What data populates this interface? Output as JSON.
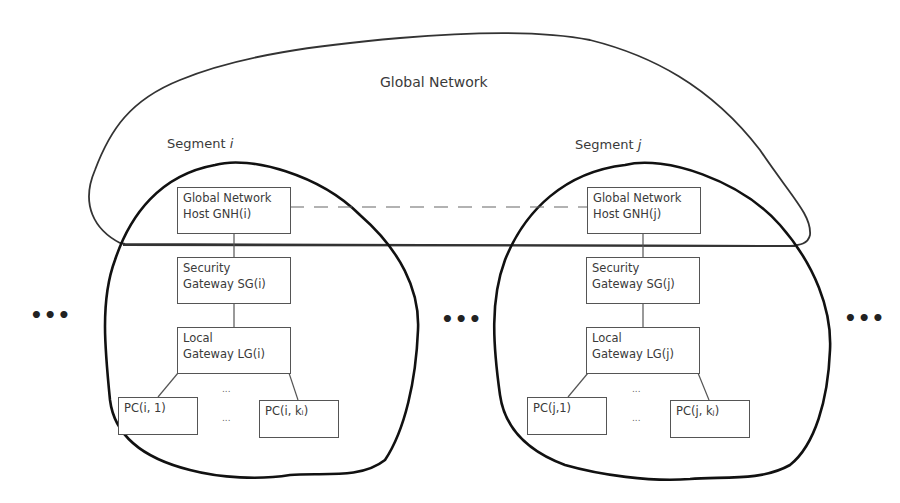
{
  "diagram": {
    "title": "Global Network",
    "segments": [
      {
        "label": "Segment ",
        "label_var": "i",
        "nodes": {
          "gnh": [
            "Global Network",
            "Host GNH(i)"
          ],
          "sg": [
            "Security",
            "Gateway SG(i)"
          ],
          "lg": [
            "Local",
            "Gateway LG(i)"
          ],
          "pc_first": "PC(i, 1)",
          "pc_last": "PC(i, kᵢ)"
        },
        "between_pcs": "...",
        "between_pcs_top": "..."
      },
      {
        "label": "Segment ",
        "label_var": "j",
        "nodes": {
          "gnh": [
            "Global Network",
            "Host GNH(j)"
          ],
          "sg": [
            "Security",
            "Gateway SG(j)"
          ],
          "lg": [
            "Local",
            "Gateway LG(j)"
          ],
          "pc_first": "PC(j,1)",
          "pc_last": "PC(j, kⱼ)"
        },
        "between_pcs": "...",
        "between_pcs_top": "..."
      }
    ],
    "ellipsis": {
      "left": "•••",
      "middle": "•••",
      "right": "•••"
    },
    "colors": {
      "outline": "#222222",
      "box_border": "#555555",
      "text": "#3a3a3a"
    }
  }
}
